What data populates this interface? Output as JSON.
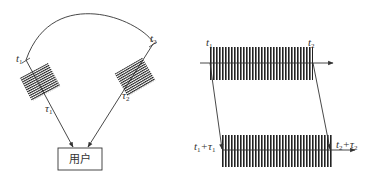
{
  "left_diagram": {
    "labels": {
      "t1": "t",
      "t1_sub": "1",
      "t2": "t",
      "t2_sub": "2",
      "tau1": "τ",
      "tau1_sub": "1",
      "tau2": "τ",
      "tau2_sub": "2"
    },
    "user_box_label": "用户"
  },
  "right_diagram": {
    "labels": {
      "t1": "t",
      "t1_sub": "1",
      "t2": "t",
      "t2_sub": "2",
      "t1_plus_tau1": "t",
      "t1_plus_tau1_sub_a": "1",
      "t1_plus_tau1_plus": "+τ",
      "t1_plus_tau1_sub_b": "1",
      "t2_plus_tau2": "t",
      "t2_plus_tau2_sub_a": "2",
      "t2_plus_tau2_plus": "+τ",
      "t2_plus_tau2_sub_b": "2"
    }
  },
  "colors": {
    "ink": "#333333",
    "background": "#ffffff"
  }
}
